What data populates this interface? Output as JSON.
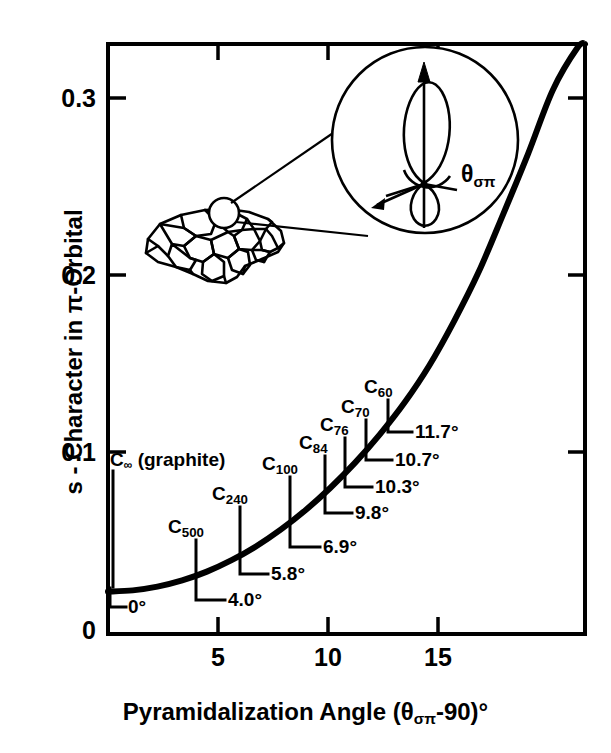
{
  "chart_data": {
    "type": "line",
    "title": "",
    "xlabel": "Pyramidalization Angle (θσπ-90)°",
    "ylabel": "s - Character in π-Orbital",
    "xlim": [
      0,
      19.3
    ],
    "ylim": [
      0,
      0.334
    ],
    "grid": false,
    "legend": "none",
    "xticks": [
      5,
      10,
      15
    ],
    "xtick_labels": [
      "5",
      "10",
      "15"
    ],
    "yticks": [
      0,
      0.1,
      0.2,
      0.3
    ],
    "ytick_labels": [
      "0",
      "0.1",
      "0.2",
      "0.3"
    ],
    "curve": {
      "name": "s-character vs pyramidalization angle",
      "x": [
        0,
        1,
        2,
        3,
        4,
        5,
        6,
        7,
        8,
        9,
        10,
        11,
        12,
        13,
        14,
        15,
        16,
        17,
        18,
        19,
        19.3
      ],
      "y": [
        0.024,
        0.0247,
        0.0268,
        0.0303,
        0.0353,
        0.0418,
        0.0497,
        0.0592,
        0.0702,
        0.0828,
        0.097,
        0.113,
        0.131,
        0.152,
        0.177,
        0.205,
        0.238,
        0.272,
        0.308,
        0.332,
        0.334
      ]
    },
    "annotations": [
      {
        "species": "C",
        "subscript": "∞",
        "label": "C∞ (graphite)",
        "angle_label": "0°",
        "angle": 0.0,
        "s_character": 0.024
      },
      {
        "species": "C",
        "subscript": "500",
        "label": "C500",
        "angle_label": "4.0°",
        "angle": 4.0,
        "s_character": 0.0353
      },
      {
        "species": "C",
        "subscript": "240",
        "label": "C240",
        "angle_label": "5.8°",
        "angle": 5.8,
        "s_character": 0.0478
      },
      {
        "species": "C",
        "subscript": "100",
        "label": "C100",
        "angle_label": "6.9°",
        "angle": 6.9,
        "s_character": 0.058
      },
      {
        "species": "C",
        "subscript": "84",
        "label": "C84",
        "angle_label": "9.8°",
        "angle": 9.8,
        "s_character": 0.08
      },
      {
        "species": "C",
        "subscript": "76",
        "label": "C76",
        "angle_label": "10.3°",
        "angle": 10.3,
        "s_character": 0.084
      },
      {
        "species": "C",
        "subscript": "70",
        "label": "C70",
        "angle_label": "10.7°",
        "angle": 10.7,
        "s_character": 0.087
      },
      {
        "species": "C",
        "subscript": "60",
        "label": "C60",
        "angle_label": "11.7°",
        "angle": 11.7,
        "s_character": 0.093
      }
    ]
  },
  "axes": {
    "y_title_pre": "s - Character in ",
    "y_title_pi": "π",
    "y_title_post": "-Orbital",
    "x_title_pre": "Pyramidalization Angle (",
    "x_title_theta": "θ",
    "x_title_theta_sub": "σπ",
    "x_title_post": "-90)°",
    "ytick_0": "0",
    "ytick_1": "0.1",
    "ytick_2": "0.2",
    "ytick_3": "0.3",
    "xtick_5": "5",
    "xtick_10": "10",
    "xtick_15": "15"
  },
  "labels": {
    "graphite_c": "C",
    "graphite_sub": "∞",
    "graphite_rest": " (graphite)",
    "angle_0": "0°",
    "c500_c": "C",
    "c500_sub": "500",
    "angle_4_0": "4.0°",
    "c240_c": "C",
    "c240_sub": "240",
    "angle_5_8": "5.8°",
    "c100_c": "C",
    "c100_sub": "100",
    "angle_6_9": "6.9°",
    "c84_c": "C",
    "c84_sub": "84",
    "angle_9_8": "9.8°",
    "c76_c": "C",
    "c76_sub": "76",
    "angle_10_3": "10.3°",
    "c70_c": "C",
    "c70_sub": "70",
    "angle_10_7": "10.7°",
    "c60_c": "C",
    "c60_sub": "60",
    "angle_11_7": "11.7°"
  },
  "inset": {
    "theta_symbol": "θ",
    "theta_subscript": "σπ",
    "description": "fullerene-cage-with-magnified-pi-orbital"
  },
  "colors": {
    "ink": "#000000",
    "background": "#ffffff"
  }
}
